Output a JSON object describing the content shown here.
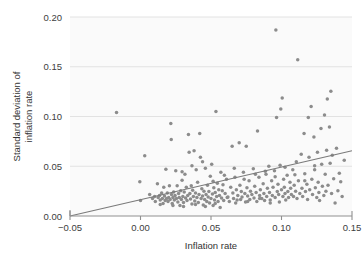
{
  "chart_data": {
    "type": "scatter",
    "title": "",
    "xlabel": "Inflation rate",
    "ylabel_line1": "Standard deviation of",
    "ylabel_line2": "inflation rate",
    "xlim": [
      -0.05,
      0.15
    ],
    "ylim": [
      0.0,
      0.2
    ],
    "xticks": [
      -0.05,
      0.0,
      0.05,
      0.1,
      0.15
    ],
    "xtick_labels": [
      "−0.05",
      "0.00",
      "0.05",
      "0.10",
      "0.15"
    ],
    "yticks": [
      0.0,
      0.05,
      0.1,
      0.15,
      0.2
    ],
    "ytick_labels": [
      "0.00",
      "0.05",
      "0.10",
      "0.15",
      "0.20"
    ],
    "grid": "horizontal",
    "legend": "none",
    "marker_color": "#8c8c8c",
    "line_color": "#7a7a7a",
    "grid_color": "#e2e2e2",
    "axis_color": "#909090",
    "plot_background": "#fafafa",
    "figure_background": "#ffffff",
    "fit_line": {
      "label": "regression line",
      "x": [
        -0.05,
        0.15
      ],
      "y": [
        0.0,
        0.0655
      ]
    },
    "points": [
      [
        -0.017,
        0.104
      ],
      [
        -0.0005,
        0.0345
      ],
      [
        0.0,
        0.0155
      ],
      [
        0.003,
        0.0605
      ],
      [
        0.0065,
        0.0215
      ],
      [
        0.0085,
        0.0175
      ],
      [
        0.01,
        0.0195
      ],
      [
        0.0105,
        0.0145
      ],
      [
        0.012,
        0.0325
      ],
      [
        0.0125,
        0.0185
      ],
      [
        0.0135,
        0.0205
      ],
      [
        0.014,
        0.016
      ],
      [
        0.015,
        0.023
      ],
      [
        0.0155,
        0.0175
      ],
      [
        0.016,
        0.0125
      ],
      [
        0.0165,
        0.029
      ],
      [
        0.017,
        0.02
      ],
      [
        0.0175,
        0.0155
      ],
      [
        0.018,
        0.047
      ],
      [
        0.0185,
        0.0175
      ],
      [
        0.019,
        0.023
      ],
      [
        0.0195,
        0.0145
      ],
      [
        0.02,
        0.0185
      ],
      [
        0.0205,
        0.0305
      ],
      [
        0.021,
        0.0165
      ],
      [
        0.0215,
        0.093
      ],
      [
        0.0218,
        0.077
      ],
      [
        0.022,
        0.0215
      ],
      [
        0.0225,
        0.0125
      ],
      [
        0.023,
        0.0185
      ],
      [
        0.0235,
        0.024
      ],
      [
        0.024,
        0.016
      ],
      [
        0.0245,
        0.0205
      ],
      [
        0.025,
        0.0455
      ],
      [
        0.0255,
        0.0175
      ],
      [
        0.026,
        0.0305
      ],
      [
        0.0265,
        0.014
      ],
      [
        0.027,
        0.0225
      ],
      [
        0.0275,
        0.0185
      ],
      [
        0.028,
        0.0105
      ],
      [
        0.0285,
        0.0255
      ],
      [
        0.029,
        0.0165
      ],
      [
        0.0295,
        0.036
      ],
      [
        0.03,
        0.0195
      ],
      [
        0.0305,
        0.0135
      ],
      [
        0.031,
        0.024
      ],
      [
        0.0315,
        0.042
      ],
      [
        0.032,
        0.018
      ],
      [
        0.0325,
        0.029
      ],
      [
        0.033,
        0.0155
      ],
      [
        0.0335,
        0.0205
      ],
      [
        0.034,
        0.082
      ],
      [
        0.0345,
        0.064
      ],
      [
        0.035,
        0.0225
      ],
      [
        0.0355,
        0.017
      ],
      [
        0.036,
        0.0305
      ],
      [
        0.0365,
        0.012
      ],
      [
        0.037,
        0.026
      ],
      [
        0.0375,
        0.0195
      ],
      [
        0.038,
        0.0655
      ],
      [
        0.0385,
        0.015
      ],
      [
        0.039,
        0.023
      ],
      [
        0.0395,
        0.0465
      ],
      [
        0.04,
        0.0185
      ],
      [
        0.0405,
        0.034
      ],
      [
        0.041,
        0.0135
      ],
      [
        0.0415,
        0.0215
      ],
      [
        0.042,
        0.083
      ],
      [
        0.0425,
        0.059
      ],
      [
        0.043,
        0.0175
      ],
      [
        0.0435,
        0.0275
      ],
      [
        0.044,
        0.02
      ],
      [
        0.0445,
        0.011
      ],
      [
        0.045,
        0.025
      ],
      [
        0.0455,
        0.0165
      ],
      [
        0.046,
        0.048
      ],
      [
        0.0465,
        0.0215
      ],
      [
        0.047,
        0.0145
      ],
      [
        0.0475,
        0.031
      ],
      [
        0.048,
        0.019
      ],
      [
        0.0485,
        0.0245
      ],
      [
        0.049,
        0.013
      ],
      [
        0.0495,
        0.04
      ],
      [
        0.05,
        0.0175
      ],
      [
        0.0505,
        0.052
      ],
      [
        0.051,
        0.022
      ],
      [
        0.0515,
        0.0105
      ],
      [
        0.052,
        0.0285
      ],
      [
        0.0525,
        0.016
      ],
      [
        0.053,
        0.0235
      ],
      [
        0.0535,
        0.105
      ],
      [
        0.054,
        0.0195
      ],
      [
        0.0545,
        0.033
      ],
      [
        0.055,
        0.0145
      ],
      [
        0.0555,
        0.0265
      ],
      [
        0.056,
        0.0205
      ],
      [
        0.0565,
        0.0085
      ],
      [
        0.057,
        0.044
      ],
      [
        0.0575,
        0.018
      ],
      [
        0.058,
        0.0255
      ],
      [
        0.0585,
        0.0315
      ],
      [
        0.059,
        0.0155
      ],
      [
        0.06,
        0.0225
      ],
      [
        0.061,
        0.037
      ],
      [
        0.062,
        0.019
      ],
      [
        0.063,
        0.0145
      ],
      [
        0.064,
        0.029
      ],
      [
        0.065,
        0.07
      ],
      [
        0.0655,
        0.023
      ],
      [
        0.066,
        0.0175
      ],
      [
        0.067,
        0.039
      ],
      [
        0.0675,
        0.013
      ],
      [
        0.068,
        0.0265
      ],
      [
        0.069,
        0.0205
      ],
      [
        0.07,
        0.0735
      ],
      [
        0.0705,
        0.031
      ],
      [
        0.071,
        0.0165
      ],
      [
        0.0715,
        0.0245
      ],
      [
        0.072,
        0.019
      ],
      [
        0.073,
        0.044
      ],
      [
        0.074,
        0.0225
      ],
      [
        0.0745,
        0.014
      ],
      [
        0.075,
        0.07
      ],
      [
        0.0755,
        0.0285
      ],
      [
        0.076,
        0.02
      ],
      [
        0.077,
        0.0355
      ],
      [
        0.0775,
        0.0165
      ],
      [
        0.078,
        0.025
      ],
      [
        0.079,
        0.0215
      ],
      [
        0.08,
        0.0475
      ],
      [
        0.0805,
        0.018
      ],
      [
        0.081,
        0.03
      ],
      [
        0.082,
        0.0235
      ],
      [
        0.0825,
        0.0145
      ],
      [
        0.083,
        0.0855
      ],
      [
        0.084,
        0.039
      ],
      [
        0.0845,
        0.0205
      ],
      [
        0.085,
        0.0265
      ],
      [
        0.086,
        0.0175
      ],
      [
        0.087,
        0.0325
      ],
      [
        0.0875,
        0.0225
      ],
      [
        0.088,
        0.0155
      ],
      [
        0.089,
        0.042
      ],
      [
        0.0895,
        0.0195
      ],
      [
        0.09,
        0.028
      ],
      [
        0.091,
        0.05
      ],
      [
        0.0915,
        0.0235
      ],
      [
        0.092,
        0.016
      ],
      [
        0.093,
        0.0355
      ],
      [
        0.0935,
        0.0205
      ],
      [
        0.094,
        0.029
      ],
      [
        0.095,
        0.0455
      ],
      [
        0.0955,
        0.0185
      ],
      [
        0.096,
        0.187
      ],
      [
        0.0965,
        0.099
      ],
      [
        0.097,
        0.0245
      ],
      [
        0.0975,
        0.032
      ],
      [
        0.098,
        0.0215
      ],
      [
        0.0985,
        0.014
      ],
      [
        0.099,
        0.051
      ],
      [
        0.0995,
        0.1075
      ],
      [
        0.1,
        0.0265
      ],
      [
        0.1005,
        0.1185
      ],
      [
        0.101,
        0.0195
      ],
      [
        0.1015,
        0.037
      ],
      [
        0.102,
        0.029
      ],
      [
        0.1025,
        0.0225
      ],
      [
        0.103,
        0.016
      ],
      [
        0.104,
        0.041
      ],
      [
        0.1045,
        0.0245
      ],
      [
        0.105,
        0.0185
      ],
      [
        0.106,
        0.034
      ],
      [
        0.1065,
        0.028
      ],
      [
        0.107,
        0.0215
      ],
      [
        0.108,
        0.0465
      ],
      [
        0.1085,
        0.0195
      ],
      [
        0.109,
        0.031
      ],
      [
        0.11,
        0.025
      ],
      [
        0.1105,
        0.0545
      ],
      [
        0.111,
        0.0175
      ],
      [
        0.1115,
        0.157
      ],
      [
        0.112,
        0.0355
      ],
      [
        0.113,
        0.0225
      ],
      [
        0.114,
        0.062
      ],
      [
        0.1145,
        0.028
      ],
      [
        0.115,
        0.0195
      ],
      [
        0.116,
        0.083
      ],
      [
        0.1165,
        0.0425
      ],
      [
        0.117,
        0.0245
      ],
      [
        0.118,
        0.032
      ],
      [
        0.1185,
        0.0165
      ],
      [
        0.119,
        0.099
      ],
      [
        0.1195,
        0.059
      ],
      [
        0.12,
        0.0265
      ],
      [
        0.121,
        0.11
      ],
      [
        0.1215,
        0.037
      ],
      [
        0.122,
        0.0215
      ],
      [
        0.123,
        0.0795
      ],
      [
        0.1235,
        0.0465
      ],
      [
        0.124,
        0.0285
      ],
      [
        0.125,
        0.0185
      ],
      [
        0.1255,
        0.064
      ],
      [
        0.126,
        0.034
      ],
      [
        0.1265,
        0.0235
      ],
      [
        0.127,
        0.0155
      ],
      [
        0.128,
        0.088
      ],
      [
        0.1285,
        0.052
      ],
      [
        0.129,
        0.03
      ],
      [
        0.13,
        0.0205
      ],
      [
        0.1305,
        0.1015
      ],
      [
        0.131,
        0.042
      ],
      [
        0.1315,
        0.025
      ],
      [
        0.132,
        0.066
      ],
      [
        0.1325,
        0.1175
      ],
      [
        0.133,
        0.031
      ],
      [
        0.134,
        0.0895
      ],
      [
        0.1345,
        0.053
      ],
      [
        0.135,
        0.1255
      ],
      [
        0.1355,
        0.0225
      ],
      [
        0.136,
        0.061
      ],
      [
        0.137,
        0.0375
      ],
      [
        0.138,
        0.013
      ],
      [
        0.139,
        0.068
      ],
      [
        0.14,
        0.0255
      ],
      [
        0.141,
        0.043
      ],
      [
        0.142,
        0.0345
      ],
      [
        0.143,
        0.0195
      ],
      [
        0.1445,
        0.056
      ],
      [
        0.014,
        0.0115
      ],
      [
        0.023,
        0.0105
      ],
      [
        0.0305,
        0.0095
      ],
      [
        0.039,
        0.0115
      ],
      [
        0.046,
        0.0095
      ],
      [
        0.053,
        0.0125
      ],
      [
        0.0615,
        0.0185
      ],
      [
        0.0685,
        0.016
      ],
      [
        0.076,
        0.0145
      ],
      [
        0.0845,
        0.0175
      ],
      [
        0.092,
        0.013
      ],
      [
        0.0295,
        0.0445
      ],
      [
        0.0365,
        0.0505
      ],
      [
        0.044,
        0.0545
      ],
      [
        0.0515,
        0.035
      ],
      [
        0.0595,
        0.041
      ],
      [
        0.0665,
        0.048
      ],
      [
        0.0735,
        0.037
      ],
      [
        0.0815,
        0.042
      ],
      [
        0.0885,
        0.045
      ],
      [
        0.0955,
        0.0395
      ],
      [
        0.1025,
        0.049
      ],
      [
        0.1095,
        0.0415
      ],
      [
        0.1165,
        0.0355
      ],
      [
        0.1235,
        0.0505
      ]
    ]
  }
}
